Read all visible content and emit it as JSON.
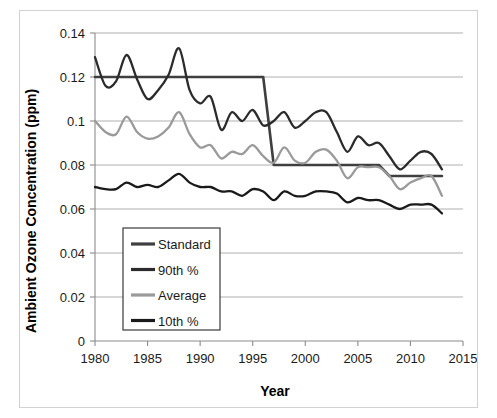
{
  "figure": {
    "clipped_header_text": "",
    "background_color": "#ffffff",
    "frame_border_color": "#d2d2d2"
  },
  "chart_data": {
    "type": "line",
    "title": "",
    "xlabel": "Year",
    "ylabel": "Ambient Ozone Concentration (ppm)",
    "xlim": [
      1980,
      2015
    ],
    "ylim": [
      0,
      0.14
    ],
    "xticks": [
      1980,
      1985,
      1990,
      1995,
      2000,
      2005,
      2010,
      2015
    ],
    "yticks": [
      0,
      0.02,
      0.04,
      0.06,
      0.08,
      0.1,
      0.12,
      0.14
    ],
    "xtick_labels": [
      "1980",
      "1985",
      "1990",
      "1995",
      "2000",
      "2005",
      "2010",
      "2015"
    ],
    "ytick_labels": [
      "0",
      "0.02",
      "0.04",
      "0.06",
      "0.08",
      "0.1",
      "0.12",
      "0.14"
    ],
    "grid": "horizontal",
    "legend_position": "inside-lower-left",
    "x": [
      1980,
      1981,
      1982,
      1983,
      1984,
      1985,
      1986,
      1987,
      1988,
      1989,
      1990,
      1991,
      1992,
      1993,
      1994,
      1995,
      1996,
      1997,
      1998,
      1999,
      2000,
      2001,
      2002,
      2003,
      2004,
      2005,
      2006,
      2007,
      2008,
      2009,
      2010,
      2011,
      2012,
      2013
    ],
    "series": [
      {
        "name": "Standard",
        "color": "#3f3f3f",
        "width": 2.6,
        "values": [
          0.12,
          0.12,
          0.12,
          0.12,
          0.12,
          0.12,
          0.12,
          0.12,
          0.12,
          0.12,
          0.12,
          0.12,
          0.12,
          0.12,
          0.12,
          0.12,
          0.12,
          0.08,
          0.08,
          0.08,
          0.08,
          0.08,
          0.08,
          0.08,
          0.08,
          0.08,
          0.08,
          0.08,
          0.075,
          0.075,
          0.075,
          0.075,
          0.075,
          0.075
        ],
        "smooth": false
      },
      {
        "name": "90th %",
        "color": "#2b2b2b",
        "width": 2.3,
        "values": [
          0.129,
          0.116,
          0.118,
          0.13,
          0.119,
          0.11,
          0.114,
          0.121,
          0.133,
          0.114,
          0.108,
          0.111,
          0.096,
          0.104,
          0.1,
          0.105,
          0.098,
          0.1,
          0.104,
          0.097,
          0.1,
          0.104,
          0.104,
          0.095,
          0.086,
          0.093,
          0.089,
          0.09,
          0.084,
          0.078,
          0.082,
          0.086,
          0.085,
          0.078
        ],
        "smooth": true
      },
      {
        "name": "Average",
        "color": "#9a9a9a",
        "width": 2.3,
        "values": [
          0.1,
          0.095,
          0.094,
          0.102,
          0.095,
          0.092,
          0.093,
          0.097,
          0.104,
          0.094,
          0.088,
          0.089,
          0.083,
          0.086,
          0.085,
          0.089,
          0.084,
          0.081,
          0.088,
          0.082,
          0.081,
          0.086,
          0.087,
          0.082,
          0.074,
          0.079,
          0.079,
          0.079,
          0.075,
          0.069,
          0.072,
          0.074,
          0.075,
          0.066
        ],
        "smooth": true
      },
      {
        "name": "10th %",
        "color": "#1a1a1a",
        "width": 2.3,
        "values": [
          0.07,
          0.069,
          0.069,
          0.072,
          0.07,
          0.071,
          0.07,
          0.073,
          0.076,
          0.072,
          0.07,
          0.07,
          0.068,
          0.068,
          0.066,
          0.069,
          0.068,
          0.064,
          0.068,
          0.066,
          0.066,
          0.068,
          0.068,
          0.067,
          0.063,
          0.065,
          0.064,
          0.064,
          0.062,
          0.06,
          0.062,
          0.062,
          0.062,
          0.058
        ],
        "smooth": true
      }
    ],
    "legend_entries": [
      {
        "label": "Standard",
        "color": "#3f3f3f"
      },
      {
        "label": "90th %",
        "color": "#2b2b2b"
      },
      {
        "label": "Average",
        "color": "#9a9a9a"
      },
      {
        "label": "10th %",
        "color": "#1a1a1a"
      }
    ]
  }
}
